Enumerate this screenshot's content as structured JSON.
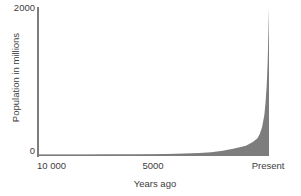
{
  "chart_data": {
    "type": "area",
    "title": "",
    "xlabel": "Years ago",
    "ylabel": "Population in millions",
    "ylim": [
      0,
      2000
    ],
    "xlim": [
      10000,
      0
    ],
    "grid": false,
    "legend": null,
    "axis": {
      "y_ticks": [
        {
          "value": 2000,
          "label": "2000"
        },
        {
          "value": 0,
          "label": "0"
        }
      ],
      "x_ticks": [
        {
          "value": 10000,
          "label": "10 000"
        },
        {
          "value": 9000,
          "label": ""
        },
        {
          "value": 8000,
          "label": ""
        },
        {
          "value": 7000,
          "label": ""
        },
        {
          "value": 6000,
          "label": ""
        },
        {
          "value": 5000,
          "label": "5000"
        },
        {
          "value": 4000,
          "label": ""
        },
        {
          "value": 3000,
          "label": ""
        },
        {
          "value": 2000,
          "label": ""
        },
        {
          "value": 1000,
          "label": ""
        },
        {
          "value": 0,
          "label": "Present"
        }
      ]
    },
    "series": [
      {
        "name": "World population",
        "fill_color": "#7d7d7d",
        "x": [
          10000,
          9000,
          8000,
          7000,
          6000,
          5000,
          4000,
          3000,
          2500,
          2000,
          1500,
          1000,
          700,
          500,
          400,
          300,
          200,
          150,
          100,
          60,
          40,
          20,
          0
        ],
        "values": [
          5,
          6,
          7,
          9,
          11,
          14,
          20,
          30,
          40,
          60,
          90,
          130,
          180,
          230,
          290,
          380,
          550,
          720,
          950,
          1250,
          1500,
          1750,
          2000
        ]
      }
    ],
    "colors": {
      "fill": "#7d7d7d",
      "axis": "#7d7d7d",
      "text": "#3d3d3d",
      "background": "#ffffff"
    }
  },
  "labels": {
    "y_top": "2000",
    "y_zero": "0",
    "x_left": "10 000",
    "x_mid": "5000",
    "x_right": "Present",
    "x_title": "Years ago",
    "y_title": "Population in millions"
  }
}
